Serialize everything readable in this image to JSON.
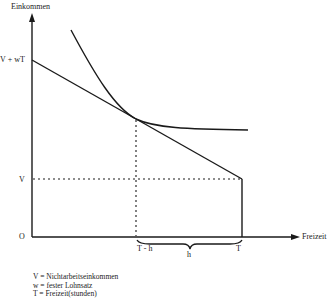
{
  "diagram": {
    "type": "labor-leisure choice (Einkommen vs. Freizeit)",
    "y_axis_label": "Einkommen",
    "x_axis_label": "Freizeit",
    "origin_label": "O",
    "y_ticks": {
      "top": "V + wT",
      "lower": "V"
    },
    "x_ticks": {
      "optimum": "T - h",
      "total": "T",
      "brace": "h"
    },
    "legend": [
      "V = Nichtarbeitseinkommen",
      "w = fester Lohnsatz",
      "T = Freizeit(stunden)"
    ],
    "colors": {
      "line": "#1a1a1a",
      "background": "#ffffff"
    }
  }
}
